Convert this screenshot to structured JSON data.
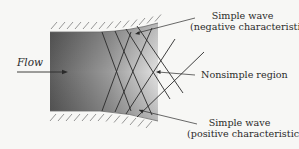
{
  "diagram": {
    "flow_label": "Flow",
    "labels": {
      "negative": {
        "line1": "Simple wave",
        "line2": "(negative characteristic)"
      },
      "nonsimple": "Nonsimple region",
      "positive": {
        "line1": "Simple wave",
        "line2": "(positive characteristic)"
      }
    },
    "colors": {
      "background": "#f7f7f5",
      "ink": "#2a2a2a",
      "duct_dark": "#5a5a5a",
      "duct_light": "#e8e8e8",
      "hatch": "#8a8a8a"
    }
  }
}
